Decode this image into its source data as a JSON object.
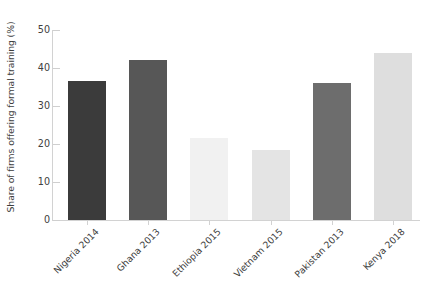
{
  "chart_data": {
    "type": "bar",
    "title": "",
    "subtitle": "",
    "xlabel": "",
    "ylabel": "Share of firms offering formal training (%)",
    "categories": [
      "Nigeria 2014",
      "Ghana 2013",
      "Ethiopia 2015",
      "Vietnam 2015",
      "Pakistan 2013",
      "Kenya 2018"
    ],
    "values": [
      36.5,
      42,
      21.5,
      18.5,
      36,
      44
    ],
    "bar_colors": [
      "#3b3b3b",
      "#575757",
      "#f1f1f1",
      "#e4e4e4",
      "#6d6d6d",
      "#dedede"
    ],
    "ylim": [
      0,
      50
    ],
    "yticks": [
      0,
      10,
      20,
      30,
      40,
      50
    ],
    "ytick_labels": [
      "0",
      "10",
      "20",
      "30",
      "40",
      "50"
    ],
    "grid": false,
    "legend": "none",
    "axis_color": "#d2d2d2",
    "background": "#ffffff"
  },
  "axis": {
    "y_title": "Share of firms offering formal training (%)"
  }
}
